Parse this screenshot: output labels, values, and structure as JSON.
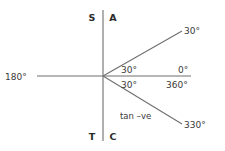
{
  "diagram": {
    "colors": {
      "line": "#6f6f6f",
      "text": "#3a3a3a",
      "quadrant_text": "#2b2b2b",
      "background": "#ffffff"
    },
    "quadrant_labels": [
      {
        "key": "sine",
        "label": "S",
        "x": 92,
        "y": 21
      },
      {
        "key": "all",
        "label": "A",
        "x": 113,
        "y": 21
      },
      {
        "key": "tangent",
        "label": "T",
        "x": 92,
        "y": 140
      },
      {
        "key": "cosine",
        "label": "C",
        "x": 113,
        "y": 140
      }
    ],
    "angle_labels": [
      {
        "key": "ray-30-endpoint",
        "label": "30°",
        "x": 184,
        "y": 34,
        "anchor": "start"
      },
      {
        "key": "interior-upper-30",
        "label": "30°",
        "x": 121,
        "y": 73,
        "anchor": "start"
      },
      {
        "key": "interior-lower-30",
        "label": "30°",
        "x": 121,
        "y": 88,
        "anchor": "start"
      },
      {
        "key": "zero-degrees",
        "label": "0°",
        "x": 178,
        "y": 73,
        "anchor": "start"
      },
      {
        "key": "three-sixty-degrees",
        "label": "360°",
        "x": 166,
        "y": 88,
        "anchor": "start"
      },
      {
        "key": "one-eighty-degrees",
        "label": "180°",
        "x": 5,
        "y": 80,
        "anchor": "start"
      },
      {
        "key": "ray-330-endpoint",
        "label": "330°",
        "x": 184,
        "y": 128,
        "anchor": "start"
      }
    ],
    "notes": [
      {
        "key": "tan-negative",
        "label": "tan –ve",
        "x": 120,
        "y": 119,
        "anchor": "start"
      }
    ],
    "axes": {
      "origin": {
        "x": 103,
        "y": 76
      },
      "vertical": {
        "x1": 103,
        "y1": 10,
        "x2": 103,
        "y2": 141
      },
      "horizontal": {
        "x1": 37,
        "y1": 76,
        "x2": 191,
        "y2": 76
      }
    },
    "rays": [
      {
        "key": "ray-30",
        "angle_deg": 30,
        "x1": 103,
        "y1": 76,
        "x2": 182,
        "y2": 31
      },
      {
        "key": "ray-330",
        "angle_deg": 330,
        "x1": 103,
        "y1": 76,
        "x2": 182,
        "y2": 124
      }
    ]
  }
}
